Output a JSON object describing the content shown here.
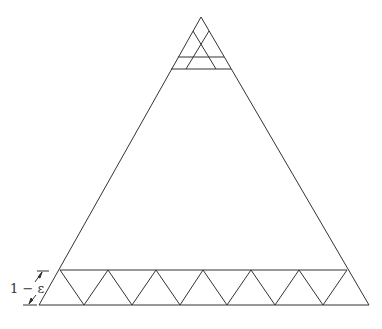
{
  "figure": {
    "stroke_color": "#333333",
    "dimension_label": "1 − ε",
    "outer_triangle": {
      "apex": [
        201,
        17
      ],
      "bottom_left": [
        39,
        305
      ],
      "bottom_right": [
        369,
        305
      ]
    },
    "bottom_strip": {
      "top_y": 270,
      "bottom_y": 305,
      "peaks_x": [
        60,
        108,
        156,
        203,
        251,
        299,
        347
      ],
      "valleys_x": [
        84,
        132,
        180,
        227,
        275,
        323
      ]
    },
    "top_region": {
      "lines_y": [
        56,
        68
      ]
    }
  }
}
